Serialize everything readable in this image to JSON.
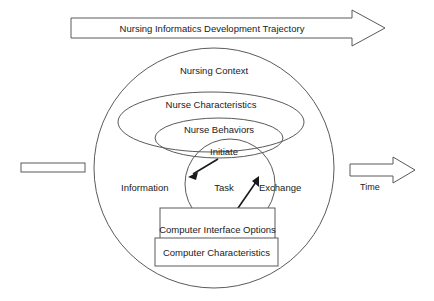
{
  "diagram": {
    "title_banner": {
      "label": "Nursing Informatics Development Trajectory",
      "shape": "right-arrow-banner"
    },
    "time_axis": {
      "label": "Time",
      "shape": "right-arrow"
    },
    "left_marker": {
      "label": "",
      "shape": "horizontal-bar"
    },
    "layers": [
      {
        "key": "nursing_context",
        "label": "Nursing Context",
        "shape": "circle"
      },
      {
        "key": "nurse_characteristics",
        "label": "Nurse Characteristics",
        "shape": "ellipse"
      },
      {
        "key": "nurse_behaviors",
        "label": "Nurse Behaviors",
        "shape": "ellipse"
      },
      {
        "key": "task",
        "label": "Task",
        "shape": "circle"
      }
    ],
    "flow_labels": {
      "left": "Information",
      "right": "Exchange",
      "initiate": "Initiate",
      "respond": "respond"
    },
    "boxes": [
      {
        "key": "computer_interface_options",
        "label": "Computer Interface Options"
      },
      {
        "key": "computer_characteristics",
        "label": "Computer Characteristics"
      }
    ],
    "colors": {
      "background": "#ffffff",
      "shape_stroke": "#5a5a5a",
      "text": "#1a1a1a",
      "arrow_stroke": "#1a1a1a"
    }
  }
}
